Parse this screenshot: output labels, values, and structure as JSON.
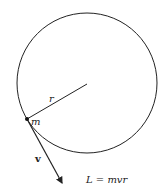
{
  "diagram": {
    "circle": {
      "cx": 87,
      "cy": 83,
      "r": 70
    },
    "mass_point": {
      "x": 27,
      "y": 119
    },
    "radius_label": "r",
    "mass_label": "m",
    "velocity_label": "v",
    "equation": "L = mvr",
    "colors": {
      "stroke": "#222222",
      "background": "#ffffff"
    }
  }
}
